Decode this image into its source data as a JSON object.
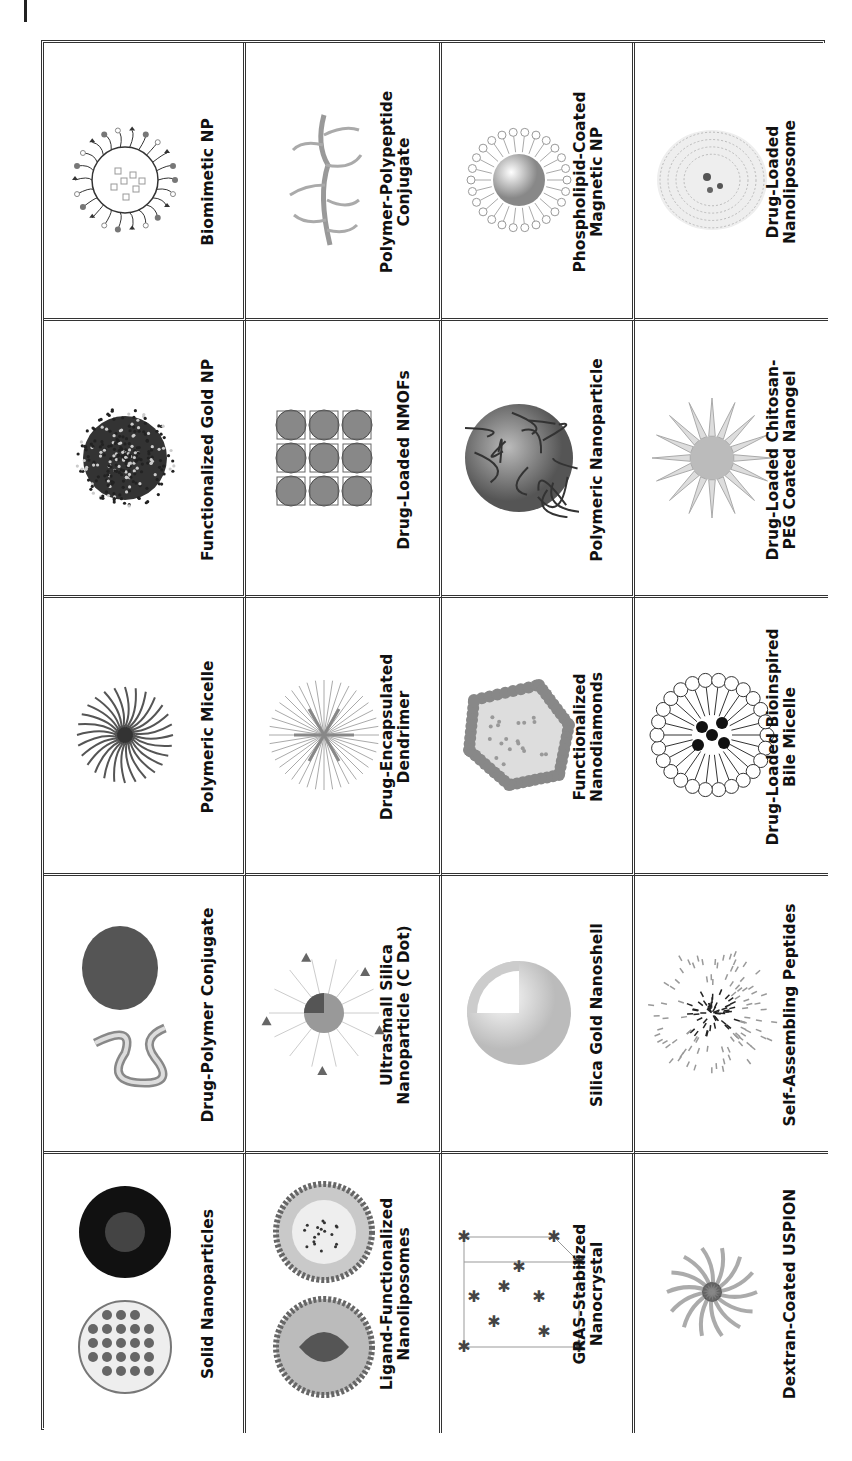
{
  "figure": {
    "orientation": "rotated-90-ccw",
    "columns": [
      {
        "cells": [
          {
            "label_lines": [
              "Biomimetic NP"
            ],
            "icon": "biomimetic-np-icon"
          },
          {
            "label_lines": [
              "Functionalized Gold NP"
            ],
            "icon": "gold-np-icon"
          },
          {
            "label_lines": [
              "Polymeric Micelle"
            ],
            "icon": "polymeric-micelle-icon"
          },
          {
            "label_lines": [
              "Drug-Polymer Conjugate"
            ],
            "icon": "drug-polymer-conjugate-icon"
          },
          {
            "label_lines": [
              "Solid Nanoparticles"
            ],
            "icon": "solid-nanoparticles-icon"
          }
        ]
      },
      {
        "cells": [
          {
            "label_lines": [
              "Polymer-Polypeptide",
              "Conjugate"
            ],
            "icon": "polymer-polypeptide-icon"
          },
          {
            "label_lines": [
              "Drug-Loaded NMOFs"
            ],
            "icon": "nmof-icon"
          },
          {
            "label_lines": [
              "Drug-Encapsulated",
              "Dendrimer"
            ],
            "icon": "dendrimer-icon"
          },
          {
            "label_lines": [
              "Ultrasmall Silica",
              "Nanoparticle (C Dot)"
            ],
            "icon": "c-dot-icon"
          },
          {
            "label_lines": [
              "Ligand-Functionalized",
              "Nanoliposomes"
            ],
            "icon": "nanoliposome-icon"
          }
        ]
      },
      {
        "cells": [
          {
            "label_lines": [
              "Phospholipid-Coated",
              "Magnetic NP"
            ],
            "icon": "phospholipid-magnetic-np-icon"
          },
          {
            "label_lines": [
              "Polymeric Nanoparticle"
            ],
            "icon": "polymeric-nanoparticle-icon"
          },
          {
            "label_lines": [
              "Functionalized",
              "Nanodiamonds"
            ],
            "icon": "nanodiamond-icon"
          },
          {
            "label_lines": [
              "Silica Gold Nanoshell"
            ],
            "icon": "nanoshell-icon"
          },
          {
            "label_lines": [
              "GRAS-Stabilized",
              "Nanocrystal"
            ],
            "icon": "nanocrystal-icon"
          }
        ]
      },
      {
        "cells": [
          {
            "label_lines": [
              "Drug-Loaded",
              "Nanoliposome"
            ],
            "icon": "drug-loaded-nanoliposome-icon"
          },
          {
            "label_lines": [
              "Drug-Loaded Chitosan-",
              "PEG Coated Nanogel"
            ],
            "icon": "nanogel-icon"
          },
          {
            "label_lines": [
              "Drug-Loaded Bioinspired",
              "Bile Micelle"
            ],
            "icon": "bile-micelle-icon"
          },
          {
            "label_lines": [
              "Self-Assembling Peptides"
            ],
            "icon": "peptide-assembly-icon"
          },
          {
            "label_lines": [
              "Dextran-Coated USPION"
            ],
            "icon": "uspion-icon"
          }
        ]
      }
    ]
  }
}
